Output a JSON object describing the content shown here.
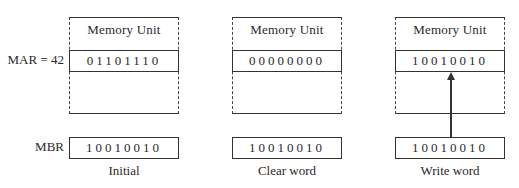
{
  "labels": {
    "mar": "MAR = 42",
    "mbr": "MBR"
  },
  "panels": [
    {
      "caption": "Initial",
      "memory_title": "Memory  Unit",
      "memory_word": "01101110",
      "mbr_word": "10010010",
      "arrow": false
    },
    {
      "caption": "Clear word",
      "memory_title": "Memory  Unit",
      "memory_word": "00000000",
      "mbr_word": "10010010",
      "arrow": false
    },
    {
      "caption": "Write word",
      "memory_title": "Memory  Unit",
      "memory_word": "10010010",
      "mbr_word": "10010010",
      "arrow": true
    }
  ]
}
